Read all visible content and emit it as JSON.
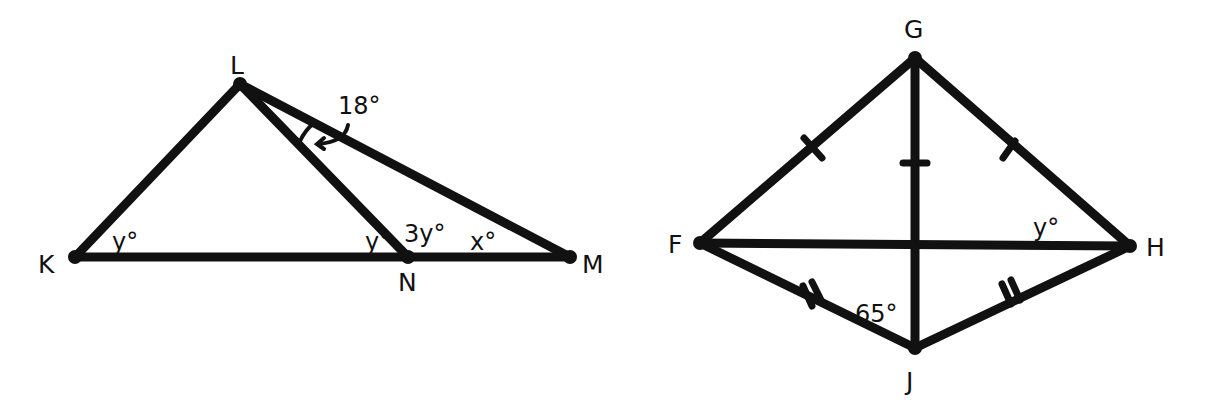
{
  "colors": {
    "stroke": "#111111",
    "background": "#ffffff"
  },
  "figure1": {
    "vertices": {
      "K": {
        "label": "K",
        "x": 75,
        "y": 257
      },
      "L": {
        "label": "L",
        "x": 240,
        "y": 84
      },
      "N": {
        "label": "N",
        "x": 408,
        "y": 257
      },
      "M": {
        "label": "M",
        "x": 570,
        "y": 257
      }
    },
    "segments": [
      "KL",
      "LN",
      "LM",
      "KM"
    ],
    "angles": {
      "K": "y°",
      "LNK": "y°",
      "LNM": "3y°",
      "M": "x°",
      "NLM": "18°"
    }
  },
  "figure2": {
    "vertices": {
      "G": {
        "label": "G",
        "x": 915,
        "y": 58
      },
      "F": {
        "label": "F",
        "x": 700,
        "y": 243
      },
      "H": {
        "label": "H",
        "x": 1130,
        "y": 246
      },
      "J": {
        "label": "J",
        "x": 915,
        "y": 348
      }
    },
    "segments": [
      "GF",
      "GH",
      "GJ",
      "FH",
      "FJ",
      "HJ"
    ],
    "congruence_marks": {
      "single": [
        "GF",
        "GH",
        "GJ-upper"
      ],
      "double": [
        "FJ",
        "HJ"
      ]
    },
    "angles": {
      "GHF": "y°",
      "FJG": "65°"
    }
  }
}
